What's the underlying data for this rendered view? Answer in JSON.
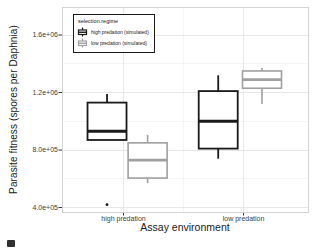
{
  "figure": {
    "background": "#ffffff"
  },
  "chart_data": {
    "type": "boxplot",
    "title": "",
    "xlabel": "Assay environment",
    "ylabel": "Parasite fitness (spores per Daphnia)",
    "categories": [
      {
        "label": "high predation",
        "x_frac": 0.25
      },
      {
        "label": "low predation",
        "x_frac": 0.738
      }
    ],
    "y_ticks": [
      {
        "label": "1.6e+06",
        "value": 1600000
      },
      {
        "label": "1.2e+06",
        "value": 1200000
      },
      {
        "label": "8.0e+05",
        "value": 800000
      },
      {
        "label": "4.0e+05",
        "value": 400000
      }
    ],
    "y_minor": [
      1400000,
      1000000,
      600000
    ],
    "x_minor_fracs": [
      0.494
    ],
    "ylim": [
      369000,
      1795000
    ],
    "grid": {
      "major_color": "#e8e8e8",
      "minor_color": "#f3f3f3",
      "panel_border": "#d4d4d4",
      "tick_color": "#333333"
    },
    "legend": {
      "title": "selection.regime",
      "entries": [
        {
          "label": "high predation (simulated)",
          "color": "#1a1a1a"
        },
        {
          "label": "low predation (simulated)",
          "color": "#a0a0a0"
        }
      ]
    },
    "series": [
      {
        "name": "high predation (simulated)",
        "color": "#1a1a1a",
        "line_width": 1.8,
        "median_width": 3,
        "boxes": [
          {
            "category": "high predation",
            "x_frac": 0.183,
            "min": 870000,
            "q1": 870000,
            "median": 930000,
            "q3": 1130000,
            "max": 1190000,
            "outliers": [
              420000
            ]
          },
          {
            "category": "low predation",
            "x_frac": 0.635,
            "min": 740000,
            "q1": 810000,
            "median": 1000000,
            "q3": 1210000,
            "max": 1320000,
            "outliers": []
          }
        ]
      },
      {
        "name": "low predation (simulated)",
        "color": "#a0a0a0",
        "line_width": 1.6,
        "median_width": 2.6,
        "boxes": [
          {
            "category": "high predation",
            "x_frac": 0.348,
            "min": 570000,
            "q1": 605000,
            "median": 730000,
            "q3": 850000,
            "max": 905000,
            "outliers": []
          },
          {
            "category": "low predation",
            "x_frac": 0.813,
            "min": 1120000,
            "q1": 1230000,
            "median": 1290000,
            "q3": 1350000,
            "max": 1370000,
            "outliers": []
          }
        ]
      }
    ]
  }
}
